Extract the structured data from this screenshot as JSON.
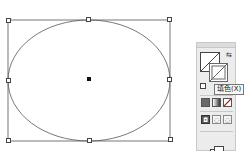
{
  "canvas": {
    "shape": "ellipse",
    "bounding_box": {
      "left": 8,
      "top": 20,
      "right": 170,
      "bottom": 141
    },
    "stroke_color": "#555555",
    "fill_color": "none"
  },
  "tools_panel": {
    "fill_swatch": "none",
    "stroke_swatch": "none",
    "swap_icon": "swap-fill-stroke-icon",
    "default_icon": "default-colors-icon",
    "tooltip": "填色(X)",
    "color_modes": [
      "color",
      "gradient",
      "none"
    ],
    "draw_modes": [
      "draw-normal",
      "draw-behind",
      "draw-inside"
    ],
    "screen_mode_icon": "change-screen-mode-icon"
  }
}
